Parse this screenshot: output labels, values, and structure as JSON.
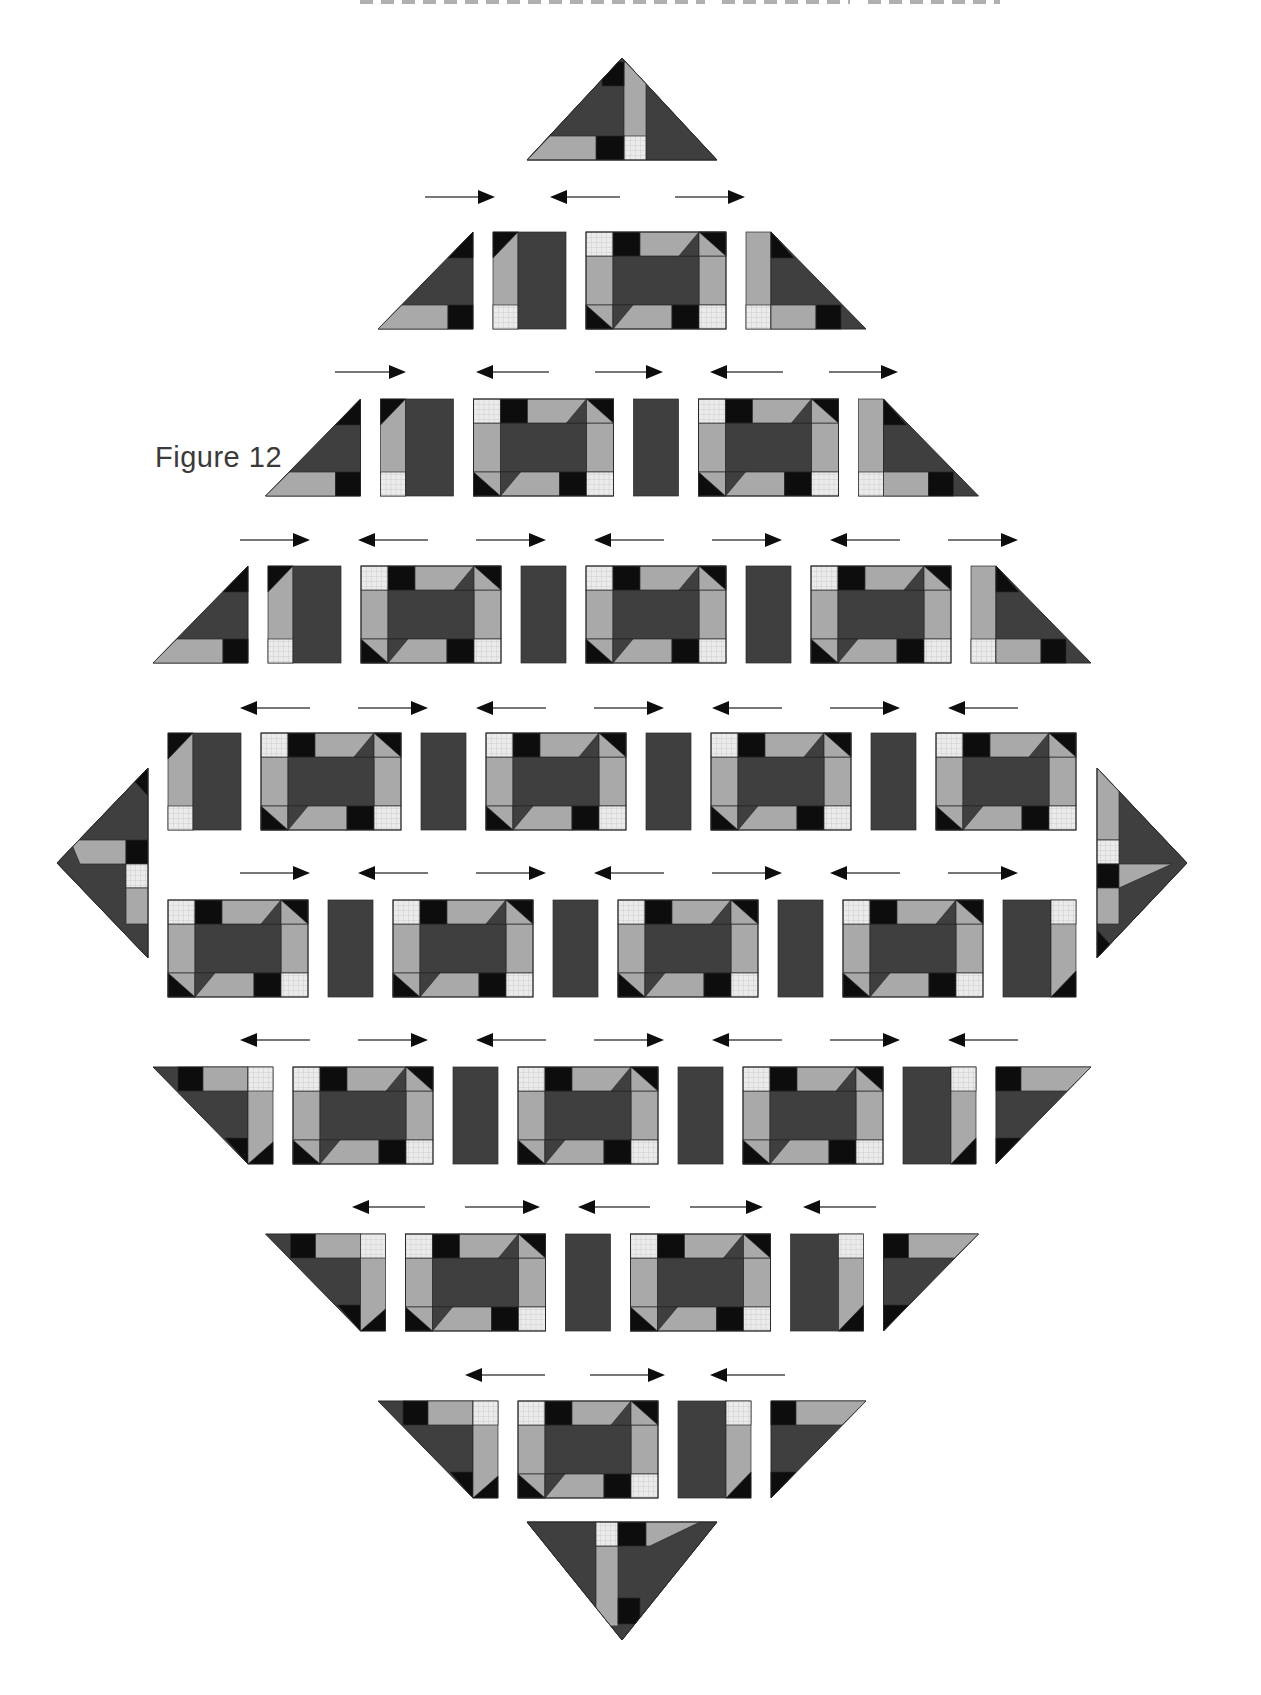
{
  "figure_label": "Figure 12",
  "page_header": {
    "description": "running head cropped at top edge (illegible letter bottoms)",
    "strips": [
      {
        "x": 360,
        "w": 345
      },
      {
        "x": 722,
        "w": 128
      },
      {
        "x": 868,
        "w": 132
      }
    ]
  },
  "colors": {
    "background": "#ffffff",
    "dark": "#3f3f3f",
    "light": "#a9a9a9",
    "black": "#0d0d0d",
    "check_bg": "#ebebeb",
    "check_line": "#cdcdcd",
    "outline": "#2a2a2a",
    "arrow_line": "#4a4a4a",
    "arrow_head": "#0d0d0d",
    "label": "#3a3a3a"
  },
  "units": {
    "canvas_w": 1261,
    "canvas_h": 1695,
    "block_w": 140,
    "block_h": 97,
    "sash_w": 45,
    "strip_w": 25,
    "s_unit_w": 73,
    "s_dark_w": 48,
    "tri_w": 95,
    "gap": 20,
    "center_x": 622
  },
  "corner_triangles": {
    "top": {
      "base_x1": 527,
      "base_x2": 717,
      "base_y": 160,
      "apex_x": 622,
      "apex_y": 58
    },
    "bottom": {
      "base_x1": 527,
      "base_x2": 717,
      "base_y": 1522,
      "apex_x": 622,
      "apex_y": 1640
    },
    "left": {
      "edge_x": 148,
      "y1": 768,
      "y2": 958,
      "apex_x": 57,
      "apex_y": 863
    },
    "right": {
      "edge_x": 1097,
      "y1": 768,
      "y2": 958,
      "apex_x": 1187,
      "apex_y": 863
    }
  },
  "rows": [
    {
      "name": "diagonal-row-1",
      "y": 232,
      "pieces": [
        "tri-ul",
        "s-unit",
        "block",
        "strip-tri-ur"
      ]
    },
    {
      "name": "diagonal-row-2",
      "y": 399,
      "pieces": [
        "tri-ul",
        "s-unit",
        "block",
        "sash",
        "block",
        "strip-tri-ur"
      ]
    },
    {
      "name": "diagonal-row-3",
      "y": 566,
      "pieces": [
        "tri-ul",
        "s-unit",
        "block",
        "sash",
        "block",
        "sash",
        "block",
        "strip-tri-ur"
      ]
    },
    {
      "name": "diagonal-row-4",
      "y": 733,
      "pieces": [
        "s-unit",
        "block",
        "sash",
        "block",
        "sash",
        "block",
        "sash",
        "block"
      ]
    },
    {
      "name": "diagonal-row-5",
      "y": 900,
      "pieces": [
        "block",
        "sash",
        "block",
        "sash",
        "block",
        "sash",
        "block",
        "s-unit-rot"
      ]
    },
    {
      "name": "diagonal-row-6",
      "y": 1067,
      "pieces": [
        "tri-ll-strip",
        "block",
        "sash",
        "block",
        "sash",
        "block",
        "s-unit-rot",
        "tri-lr"
      ]
    },
    {
      "name": "diagonal-row-7",
      "y": 1234,
      "pieces": [
        "tri-ll-strip",
        "block",
        "sash",
        "block",
        "s-unit-rot",
        "tri-lr"
      ]
    },
    {
      "name": "diagonal-row-8",
      "y": 1401,
      "pieces": [
        "tri-ll-strip",
        "block",
        "s-unit-rot",
        "tri-lr"
      ]
    }
  ],
  "arrow_rows": [
    {
      "y": 197,
      "arrows": [
        {
          "x1": 425,
          "x2": 495,
          "dir": "right"
        },
        {
          "x1": 550,
          "x2": 620,
          "dir": "left"
        },
        {
          "x1": 675,
          "x2": 745,
          "dir": "right"
        }
      ]
    },
    {
      "y": 372,
      "arrows": [
        {
          "x1": 335,
          "x2": 406,
          "dir": "right"
        },
        {
          "x1": 476,
          "x2": 549,
          "dir": "left"
        },
        {
          "x1": 595,
          "x2": 663,
          "dir": "right"
        },
        {
          "x1": 710,
          "x2": 783,
          "dir": "left"
        },
        {
          "x1": 829,
          "x2": 898,
          "dir": "right"
        }
      ]
    },
    {
      "y": 540,
      "arrows": [
        {
          "x1": 240,
          "x2": 310,
          "dir": "right"
        },
        {
          "x1": 358,
          "x2": 428,
          "dir": "left"
        },
        {
          "x1": 476,
          "x2": 546,
          "dir": "right"
        },
        {
          "x1": 594,
          "x2": 664,
          "dir": "left"
        },
        {
          "x1": 712,
          "x2": 782,
          "dir": "right"
        },
        {
          "x1": 830,
          "x2": 900,
          "dir": "left"
        },
        {
          "x1": 948,
          "x2": 1018,
          "dir": "right"
        }
      ]
    },
    {
      "y": 708,
      "arrows": [
        {
          "x1": 240,
          "x2": 310,
          "dir": "left"
        },
        {
          "x1": 358,
          "x2": 428,
          "dir": "right"
        },
        {
          "x1": 476,
          "x2": 546,
          "dir": "left"
        },
        {
          "x1": 594,
          "x2": 664,
          "dir": "right"
        },
        {
          "x1": 712,
          "x2": 782,
          "dir": "left"
        },
        {
          "x1": 830,
          "x2": 900,
          "dir": "right"
        },
        {
          "x1": 948,
          "x2": 1018,
          "dir": "left"
        }
      ]
    },
    {
      "y": 873,
      "arrows": [
        {
          "x1": 240,
          "x2": 310,
          "dir": "right"
        },
        {
          "x1": 358,
          "x2": 428,
          "dir": "left"
        },
        {
          "x1": 476,
          "x2": 546,
          "dir": "right"
        },
        {
          "x1": 594,
          "x2": 664,
          "dir": "left"
        },
        {
          "x1": 712,
          "x2": 782,
          "dir": "right"
        },
        {
          "x1": 830,
          "x2": 900,
          "dir": "left"
        },
        {
          "x1": 948,
          "x2": 1018,
          "dir": "right"
        }
      ]
    },
    {
      "y": 1040,
      "arrows": [
        {
          "x1": 240,
          "x2": 310,
          "dir": "left"
        },
        {
          "x1": 358,
          "x2": 428,
          "dir": "right"
        },
        {
          "x1": 476,
          "x2": 546,
          "dir": "left"
        },
        {
          "x1": 594,
          "x2": 664,
          "dir": "right"
        },
        {
          "x1": 712,
          "x2": 782,
          "dir": "left"
        },
        {
          "x1": 830,
          "x2": 900,
          "dir": "right"
        },
        {
          "x1": 948,
          "x2": 1018,
          "dir": "left"
        }
      ]
    },
    {
      "y": 1207,
      "arrows": [
        {
          "x1": 352,
          "x2": 425,
          "dir": "left"
        },
        {
          "x1": 465,
          "x2": 540,
          "dir": "right"
        },
        {
          "x1": 578,
          "x2": 650,
          "dir": "left"
        },
        {
          "x1": 690,
          "x2": 763,
          "dir": "right"
        },
        {
          "x1": 803,
          "x2": 876,
          "dir": "left"
        }
      ]
    },
    {
      "y": 1375,
      "arrows": [
        {
          "x1": 465,
          "x2": 545,
          "dir": "left"
        },
        {
          "x1": 590,
          "x2": 665,
          "dir": "right"
        },
        {
          "x1": 710,
          "x2": 785,
          "dir": "left"
        }
      ]
    }
  ]
}
